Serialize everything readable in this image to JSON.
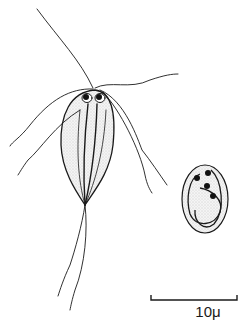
{
  "figure": {
    "subjects": [
      {
        "name": "trophozoite",
        "description": "Pear-shaped flagellated protozoan with paired nuclei, axonemes and eight flagella"
      },
      {
        "name": "cyst",
        "description": "Oval cyst with four nuclei and internal fibrils"
      }
    ],
    "scale_bar": {
      "label": "10μ",
      "value": 10,
      "unit": "μ"
    },
    "colors": {
      "ink": "#1a1a1a",
      "stipple": "#cfcfcf",
      "background": "#ffffff"
    }
  }
}
